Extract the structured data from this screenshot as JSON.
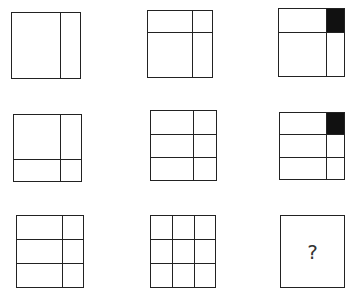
{
  "line_color": "#222222",
  "fill_color": "#111111",
  "cells": [
    {
      "row": 1,
      "col": 1,
      "x": 11,
      "y": 12,
      "w": 70,
      "h": 67,
      "vlines": [
        0.7
      ],
      "hlines": [],
      "filled": []
    },
    {
      "row": 1,
      "col": 2,
      "x": 147,
      "y": 10,
      "w": 66,
      "h": 68,
      "vlines": [
        0.68
      ],
      "hlines": [
        0.32
      ],
      "filled": []
    },
    {
      "row": 1,
      "col": 3,
      "x": 278,
      "y": 8,
      "w": 67,
      "h": 69,
      "vlines": [
        0.72
      ],
      "hlines": [
        0.35
      ],
      "filled": [
        {
          "x0": 0.72,
          "y0": 0,
          "x1": 1,
          "y1": 0.35
        }
      ]
    },
    {
      "row": 2,
      "col": 1,
      "x": 13,
      "y": 114,
      "w": 69,
      "h": 68,
      "vlines": [
        0.68
      ],
      "hlines": [
        0.66
      ],
      "filled": []
    },
    {
      "row": 2,
      "col": 2,
      "x": 150,
      "y": 110,
      "w": 67,
      "h": 71,
      "vlines": [
        0.65
      ],
      "hlines": [
        0.33,
        0.66
      ],
      "filled": []
    },
    {
      "row": 2,
      "col": 3,
      "x": 279,
      "y": 112,
      "w": 66,
      "h": 68,
      "vlines": [
        0.72
      ],
      "hlines": [
        0.32,
        0.66
      ],
      "filled": [
        {
          "x0": 0.72,
          "y0": 0,
          "x1": 1,
          "y1": 0.32
        }
      ]
    },
    {
      "row": 3,
      "col": 1,
      "x": 16,
      "y": 215,
      "w": 68,
      "h": 73,
      "vlines": [
        0.68
      ],
      "hlines": [
        0.33,
        0.66
      ],
      "filled": []
    },
    {
      "row": 3,
      "col": 2,
      "x": 150,
      "y": 215,
      "w": 66,
      "h": 73,
      "vlines": [
        0.33,
        0.67
      ],
      "hlines": [
        0.33,
        0.66
      ],
      "filled": []
    },
    {
      "row": 3,
      "col": 3,
      "x": 280,
      "y": 215,
      "w": 65,
      "h": 73,
      "vlines": [],
      "hlines": [],
      "filled": [],
      "label": "?"
    }
  ],
  "answer_placeholder": "?"
}
